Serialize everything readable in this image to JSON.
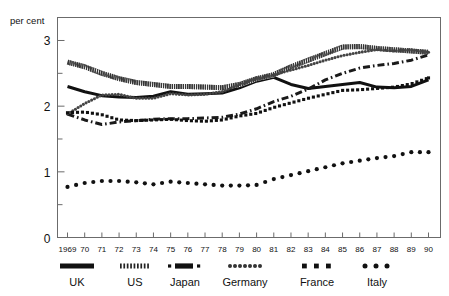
{
  "chart_data": {
    "type": "line",
    "title": "",
    "subtitle": "",
    "ylabel": "per cent",
    "xlabel": "",
    "ylim": [
      0,
      3.35
    ],
    "yticks": [
      0,
      1,
      2,
      3
    ],
    "yticklabels": [
      "0",
      "1",
      "2",
      "3"
    ],
    "yminorticks": [
      0.5,
      1.5,
      2.5
    ],
    "grid": false,
    "legend_position": "bottom",
    "x": [
      1969,
      1970,
      1971,
      1972,
      1973,
      1974,
      1975,
      1976,
      1977,
      1978,
      1979,
      1980,
      1981,
      1982,
      1983,
      1984,
      1985,
      1986,
      1987,
      1988,
      1989,
      1990
    ],
    "xticklabels": [
      "1969",
      "70",
      "71",
      "72",
      "73",
      "74",
      "75",
      "76",
      "77",
      "78",
      "79",
      "80",
      "81",
      "82",
      "83",
      "84",
      "85",
      "86",
      "87",
      "88",
      "89",
      "90"
    ],
    "series": [
      {
        "name": "UK",
        "style": "solid",
        "color": "#111111",
        "values": [
          2.3,
          2.22,
          2.16,
          2.14,
          2.13,
          2.15,
          2.22,
          2.18,
          2.19,
          2.2,
          2.28,
          2.38,
          2.44,
          2.33,
          2.27,
          2.3,
          2.33,
          2.36,
          2.29,
          2.28,
          2.3,
          2.4
        ]
      },
      {
        "name": "US",
        "style": "hatched",
        "color": "#333333",
        "values": [
          2.67,
          2.6,
          2.5,
          2.42,
          2.36,
          2.33,
          2.3,
          2.3,
          2.29,
          2.28,
          2.33,
          2.42,
          2.48,
          2.6,
          2.7,
          2.8,
          2.9,
          2.91,
          2.88,
          2.86,
          2.84,
          2.82
        ]
      },
      {
        "name": "Japan",
        "style": "dash-dot",
        "color": "#1a1a1a",
        "values": [
          1.88,
          1.79,
          1.72,
          1.76,
          1.78,
          1.8,
          1.81,
          1.81,
          1.82,
          1.83,
          1.88,
          1.96,
          2.07,
          2.15,
          2.26,
          2.4,
          2.5,
          2.58,
          2.62,
          2.65,
          2.7,
          2.78
        ]
      },
      {
        "name": "Germany",
        "style": "dotted-chain",
        "color": "#444444",
        "values": [
          1.88,
          2.04,
          2.17,
          2.18,
          2.12,
          2.12,
          2.19,
          2.17,
          2.18,
          2.22,
          2.33,
          2.42,
          2.48,
          2.55,
          2.62,
          2.7,
          2.77,
          2.82,
          2.86,
          2.84,
          2.86,
          2.82
        ]
      },
      {
        "name": "France",
        "style": "square-dot",
        "color": "#111111",
        "values": [
          1.9,
          1.91,
          1.87,
          1.79,
          1.78,
          1.79,
          1.8,
          1.78,
          1.77,
          1.79,
          1.85,
          1.89,
          1.98,
          2.05,
          2.12,
          2.18,
          2.24,
          2.25,
          2.27,
          2.29,
          2.34,
          2.43
        ]
      },
      {
        "name": "Italy",
        "style": "round-dot",
        "color": "#111111",
        "values": [
          0.77,
          0.83,
          0.86,
          0.86,
          0.84,
          0.81,
          0.85,
          0.83,
          0.81,
          0.79,
          0.79,
          0.8,
          0.89,
          0.95,
          1.01,
          1.07,
          1.13,
          1.17,
          1.21,
          1.24,
          1.3,
          1.3
        ]
      }
    ]
  },
  "legend": {
    "items": [
      {
        "label": "UK",
        "swatch": "solid"
      },
      {
        "label": "US",
        "swatch": "hatched"
      },
      {
        "label": "Japan",
        "swatch": "dash-dot"
      },
      {
        "label": "Germany",
        "swatch": "dotted-chain"
      },
      {
        "label": "France",
        "swatch": "square-dot"
      },
      {
        "label": "Italy",
        "swatch": "round-dot"
      }
    ]
  }
}
